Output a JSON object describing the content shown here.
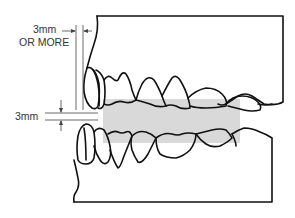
{
  "diagram": {
    "type": "dental bite registration cross-section",
    "labels": {
      "horizontal_clearance_line1": "3mm",
      "horizontal_clearance_line2": "OR MORE",
      "vertical_thickness": "3mm"
    },
    "colors": {
      "outline": "#111111",
      "bite_material": "#d9d9d9",
      "dimension_lines": "#444444",
      "background": "#ffffff"
    },
    "elements": [
      "upper-jaw-model",
      "lower-jaw-model",
      "bite-registration-material",
      "horizontal-dimension-3mm-or-more",
      "vertical-dimension-3mm"
    ]
  }
}
